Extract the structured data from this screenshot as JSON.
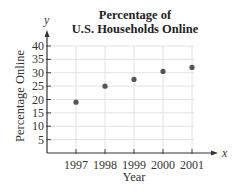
{
  "chart_data": {
    "type": "scatter",
    "title": "Percentage of U.S. Households Online",
    "title_lines": [
      "Percentage of",
      "U.S. Households Online"
    ],
    "xlabel": "Year",
    "ylabel": "Percentage Online",
    "x_axis_letter": "x",
    "y_axis_letter": "y",
    "x": [
      1997,
      1998,
      1999,
      2000,
      2001
    ],
    "y": [
      19,
      25,
      27.5,
      30.5,
      32
    ],
    "x_tick_labels": [
      "1997",
      "1998",
      "1999",
      "2000",
      "2001"
    ],
    "y_ticks": [
      5,
      10,
      15,
      20,
      25,
      30,
      35,
      40
    ],
    "ylim": [
      0,
      40
    ],
    "grid": true,
    "legend": null,
    "marker_color": "#555555"
  }
}
